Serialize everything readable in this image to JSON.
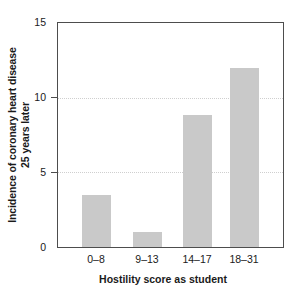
{
  "chart_data": {
    "type": "bar",
    "title": "",
    "subtitle": "",
    "xlabel": "Hostility score as student",
    "ylabel": "Incidence of coronary heart disease 25 years later",
    "ylabel_line1": "Incidence of coronary heart disease",
    "ylabel_line2": "25 years later",
    "categories": [
      "0–8",
      "9–13",
      "14–17",
      "18–31"
    ],
    "values": [
      3.45,
      1.0,
      8.85,
      12.0
    ],
    "ylim": [
      0,
      15
    ],
    "yticks": [
      0,
      5,
      10,
      15
    ],
    "ytick_labels": [
      "0",
      "5",
      "10",
      "15"
    ],
    "gridlines": [
      5,
      10
    ],
    "grid": "horizontal-dotted",
    "legend": "none",
    "bar_color": "#c9c9c9",
    "axis_color": "#4d4d4d",
    "grid_color": "#cfcfcf",
    "background": "#ffffff"
  },
  "axes": {
    "y_tick_0": "0",
    "y_tick_1": "5",
    "y_tick_2": "10",
    "y_tick_3": "15",
    "x_tick_0": "0–8",
    "x_tick_1": "9–13",
    "x_tick_2": "14–17",
    "x_tick_3": "18–31"
  }
}
